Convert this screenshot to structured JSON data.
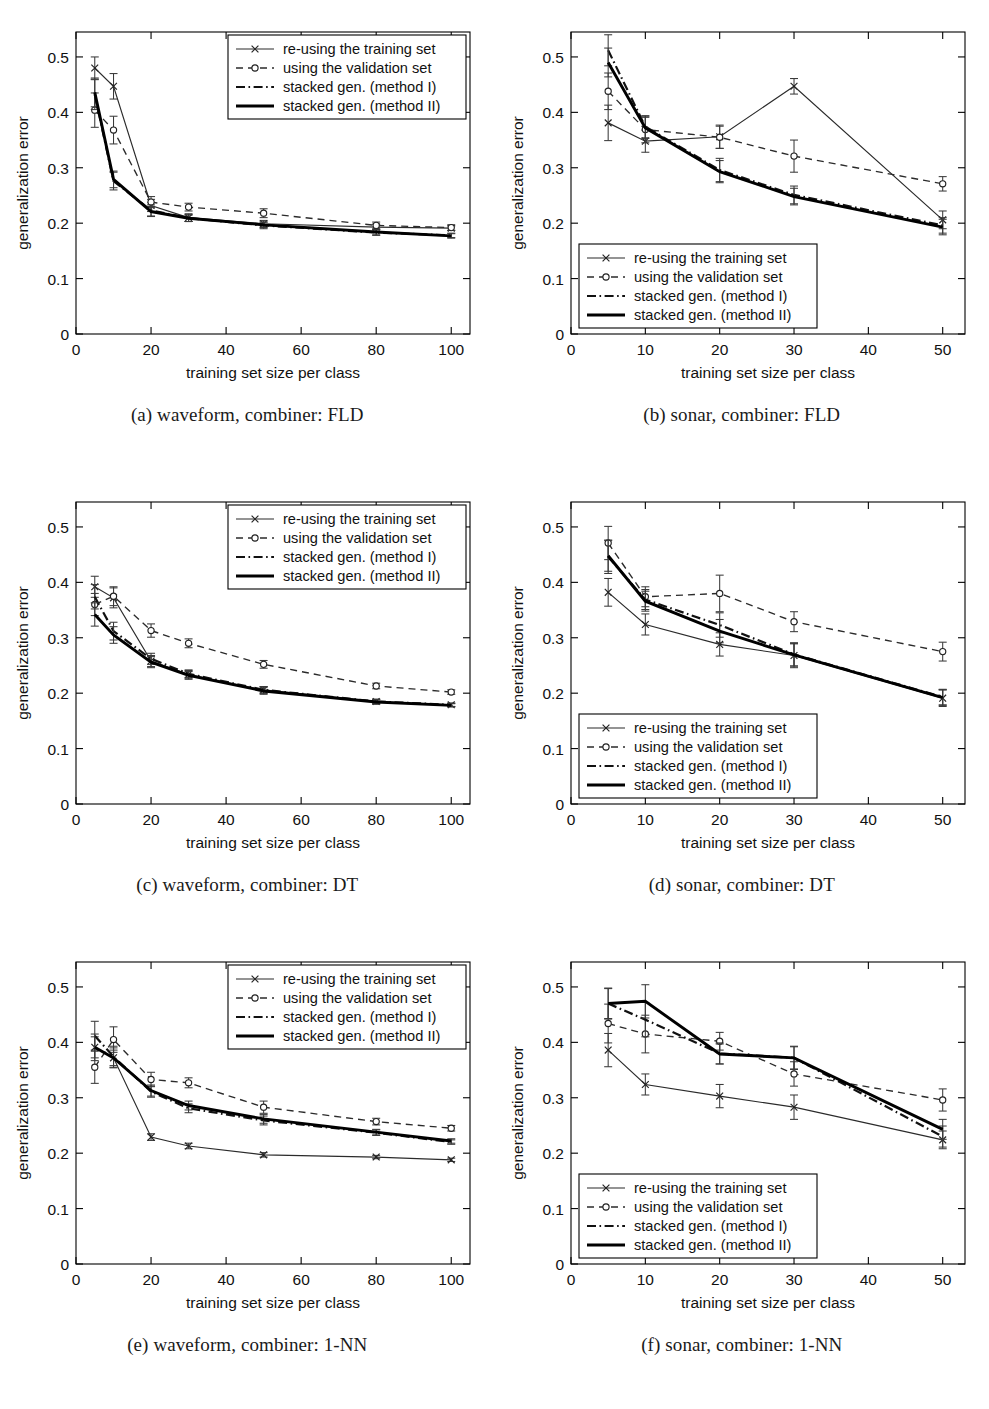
{
  "figure": {
    "axis": {
      "xlabel": "training set size per class",
      "ylabel": "generalization error"
    },
    "legend_entries": [
      {
        "label": "re-using the training set",
        "style": "solid-thin-marker-x"
      },
      {
        "label": "using the validation set",
        "style": "dashed-marker-circle"
      },
      {
        "label": "stacked gen. (method I)",
        "style": "dash-dot-thick"
      },
      {
        "label": "stacked gen. (method II)",
        "style": "solid-thick"
      }
    ],
    "series_names": [
      "re-using the training set",
      "using the validation set",
      "stacked gen. (method I)",
      "stacked gen. (method II)"
    ]
  },
  "chart_data": [
    {
      "id": "a",
      "type": "line",
      "title": "(a) waveform, combiner: FLD",
      "caption_letter": "(a)",
      "caption_text": "waveform, combiner: FLD",
      "xlabel": "training set size per class",
      "ylabel": "generalization error",
      "xlim": [
        0,
        105
      ],
      "ylim": [
        0,
        0.545
      ],
      "xticks": [
        0,
        20,
        40,
        60,
        80,
        100
      ],
      "xticklabels": [
        "0",
        "20",
        "40",
        "60",
        "80",
        "100"
      ],
      "yticks": [
        0,
        0.1,
        0.2,
        0.3,
        0.4,
        0.5
      ],
      "yticklabels": [
        "0",
        "0.1",
        "0.2",
        "0.3",
        "0.4",
        "0.5"
      ],
      "x": [
        5,
        10,
        20,
        30,
        50,
        80,
        100
      ],
      "legend_position": "top-right",
      "grid": false,
      "series": [
        {
          "name": "re-using the training set",
          "style": "solid-thin-marker-x",
          "values": [
            0.48,
            0.447,
            0.232,
            0.21,
            0.199,
            0.193,
            0.191
          ],
          "err": [
            0.02,
            0.023,
            0.011,
            0.007,
            0.006,
            0.005,
            0.004
          ]
        },
        {
          "name": "using the validation set",
          "style": "dashed-marker-circle",
          "values": [
            0.404,
            0.368,
            0.238,
            0.229,
            0.218,
            0.196,
            0.192
          ],
          "err": [
            0.031,
            0.025,
            0.01,
            0.007,
            0.008,
            0.006,
            0.005
          ]
        },
        {
          "name": "stacked gen. (method I)",
          "style": "dash-dot-thick",
          "values": [
            0.432,
            0.276,
            0.223,
            0.209,
            0.196,
            0.183,
            0.178
          ],
          "err": [
            0.027,
            0.016,
            0.01,
            0.006,
            0.006,
            0.005,
            0.004
          ]
        },
        {
          "name": "stacked gen. (method II)",
          "style": "solid-thick",
          "values": [
            0.436,
            0.279,
            0.221,
            0.209,
            0.197,
            0.184,
            0.177
          ],
          "err": [
            0.026,
            0.015,
            0.009,
            0.006,
            0.005,
            0.005,
            0.004
          ]
        }
      ]
    },
    {
      "id": "b",
      "type": "line",
      "title": "(b) sonar, combiner: FLD",
      "caption_letter": "(b)",
      "caption_text": "sonar, combiner: FLD",
      "xlabel": "training set size per class",
      "ylabel": "generalization error",
      "xlim": [
        0,
        53
      ],
      "ylim": [
        0,
        0.545
      ],
      "xticks": [
        0,
        10,
        20,
        30,
        40,
        50
      ],
      "xticklabels": [
        "0",
        "10",
        "20",
        "30",
        "40",
        "50"
      ],
      "yticks": [
        0,
        0.1,
        0.2,
        0.3,
        0.4,
        0.5
      ],
      "yticklabels": [
        "0",
        "0.1",
        "0.2",
        "0.3",
        "0.4",
        "0.5"
      ],
      "x": [
        5,
        10,
        20,
        30,
        50
      ],
      "legend_position": "bottom-left",
      "grid": false,
      "series": [
        {
          "name": "re-using the training set",
          "style": "solid-thin-marker-x",
          "values": [
            0.381,
            0.348,
            0.356,
            0.447,
            0.206
          ],
          "err": [
            0.032,
            0.02,
            0.021,
            0.014,
            0.016
          ]
        },
        {
          "name": "using the validation set",
          "style": "dashed-marker-circle",
          "values": [
            0.438,
            0.369,
            0.355,
            0.321,
            0.271
          ],
          "err": [
            0.033,
            0.024,
            0.02,
            0.029,
            0.013
          ]
        },
        {
          "name": "stacked gen. (method I)",
          "style": "dash-dot-thick",
          "values": [
            0.512,
            0.374,
            0.296,
            0.251,
            0.196
          ],
          "err": [
            0.028,
            0.02,
            0.021,
            0.016,
            0.014
          ]
        },
        {
          "name": "stacked gen. (method II)",
          "style": "solid-thick",
          "values": [
            0.49,
            0.372,
            0.293,
            0.248,
            0.193
          ],
          "err": [
            0.026,
            0.019,
            0.02,
            0.015,
            0.014
          ]
        }
      ]
    },
    {
      "id": "c",
      "type": "line",
      "title": "(c) waveform, combiner: DT",
      "caption_letter": "(c)",
      "caption_text": "waveform, combiner: DT",
      "xlabel": "training set size per class",
      "ylabel": "generalization error",
      "xlim": [
        0,
        105
      ],
      "ylim": [
        0,
        0.545
      ],
      "xticks": [
        0,
        20,
        40,
        60,
        80,
        100
      ],
      "xticklabels": [
        "0",
        "20",
        "40",
        "60",
        "80",
        "100"
      ],
      "yticks": [
        0,
        0.1,
        0.2,
        0.3,
        0.4,
        0.5
      ],
      "yticklabels": [
        "0",
        "0.1",
        "0.2",
        "0.3",
        "0.4",
        "0.5"
      ],
      "x": [
        5,
        10,
        20,
        30,
        50,
        80,
        100
      ],
      "legend_position": "top-right",
      "grid": false,
      "series": [
        {
          "name": "re-using the training set",
          "style": "solid-thin-marker-x",
          "values": [
            0.392,
            0.372,
            0.258,
            0.234,
            0.206,
            0.185,
            0.179
          ],
          "err": [
            0.019,
            0.018,
            0.01,
            0.007,
            0.006,
            0.004,
            0.003
          ]
        },
        {
          "name": "using the validation set",
          "style": "dashed-marker-circle",
          "values": [
            0.36,
            0.375,
            0.313,
            0.29,
            0.252,
            0.213,
            0.202
          ],
          "err": [
            0.02,
            0.017,
            0.012,
            0.008,
            0.007,
            0.005,
            0.004
          ]
        },
        {
          "name": "stacked gen. (method I)",
          "style": "dash-dot-thick",
          "values": [
            0.374,
            0.312,
            0.262,
            0.235,
            0.206,
            0.185,
            0.179
          ],
          "err": [
            0.022,
            0.016,
            0.01,
            0.007,
            0.006,
            0.004,
            0.003
          ]
        },
        {
          "name": "stacked gen. (method II)",
          "style": "solid-thick",
          "values": [
            0.342,
            0.305,
            0.256,
            0.232,
            0.204,
            0.184,
            0.178
          ],
          "err": [
            0.021,
            0.015,
            0.01,
            0.007,
            0.006,
            0.004,
            0.003
          ]
        }
      ]
    },
    {
      "id": "d",
      "type": "line",
      "title": "(d) sonar, combiner: DT",
      "caption_letter": "(d)",
      "caption_text": "sonar, combiner: DT",
      "xlabel": "training set size per class",
      "ylabel": "generalization error",
      "xlim": [
        0,
        53
      ],
      "ylim": [
        0,
        0.545
      ],
      "xticks": [
        0,
        10,
        20,
        30,
        40,
        50
      ],
      "xticklabels": [
        "0",
        "10",
        "20",
        "30",
        "40",
        "50"
      ],
      "yticks": [
        0,
        0.1,
        0.2,
        0.3,
        0.4,
        0.5
      ],
      "yticklabels": [
        "0",
        "0.1",
        "0.2",
        "0.3",
        "0.4",
        "0.5"
      ],
      "x": [
        5,
        10,
        20,
        30,
        50
      ],
      "legend_position": "bottom-left",
      "grid": false,
      "series": [
        {
          "name": "re-using the training set",
          "style": "solid-thin-marker-x",
          "values": [
            0.382,
            0.324,
            0.288,
            0.268,
            0.191
          ],
          "err": [
            0.025,
            0.019,
            0.021,
            0.022,
            0.015
          ]
        },
        {
          "name": "using the validation set",
          "style": "dashed-marker-circle",
          "values": [
            0.471,
            0.374,
            0.38,
            0.329,
            0.275
          ],
          "err": [
            0.03,
            0.018,
            0.033,
            0.018,
            0.017
          ]
        },
        {
          "name": "stacked gen. (method I)",
          "style": "dash-dot-thick",
          "values": [
            0.446,
            0.369,
            0.323,
            0.27,
            0.193
          ],
          "err": [
            0.03,
            0.018,
            0.022,
            0.021,
            0.014
          ]
        },
        {
          "name": "stacked gen. (method II)",
          "style": "solid-thick",
          "values": [
            0.448,
            0.366,
            0.312,
            0.269,
            0.192
          ],
          "err": [
            0.028,
            0.018,
            0.021,
            0.02,
            0.014
          ]
        }
      ]
    },
    {
      "id": "e",
      "type": "line",
      "title": "(e) waveform, combiner: 1-NN",
      "caption_letter": "(e)",
      "caption_text": "waveform, combiner: 1-NN",
      "xlabel": "training set size per class",
      "ylabel": "generalization error",
      "xlim": [
        0,
        105
      ],
      "ylim": [
        0,
        0.545
      ],
      "xticks": [
        0,
        20,
        40,
        60,
        80,
        100
      ],
      "xticklabels": [
        "0",
        "20",
        "40",
        "60",
        "80",
        "100"
      ],
      "yticks": [
        0,
        0.1,
        0.2,
        0.3,
        0.4,
        0.5
      ],
      "yticklabels": [
        "0",
        "0.1",
        "0.2",
        "0.3",
        "0.4",
        "0.5"
      ],
      "x": [
        5,
        10,
        20,
        30,
        50,
        80,
        100
      ],
      "legend_position": "top-right",
      "grid": false,
      "series": [
        {
          "name": "re-using the training set",
          "style": "solid-thin-marker-x",
          "values": [
            0.391,
            0.372,
            0.229,
            0.213,
            0.197,
            0.193,
            0.188
          ],
          "err": [
            0.019,
            0.014,
            0.006,
            0.005,
            0.004,
            0.003,
            0.003
          ]
        },
        {
          "name": "using the validation set",
          "style": "dashed-marker-circle",
          "values": [
            0.355,
            0.405,
            0.333,
            0.327,
            0.283,
            0.257,
            0.245
          ],
          "err": [
            0.029,
            0.023,
            0.013,
            0.009,
            0.011,
            0.006,
            0.005
          ]
        },
        {
          "name": "stacked gen. (method I)",
          "style": "dash-dot-thick",
          "values": [
            0.412,
            0.374,
            0.311,
            0.281,
            0.259,
            0.237,
            0.22
          ],
          "err": [
            0.026,
            0.019,
            0.01,
            0.008,
            0.008,
            0.005,
            0.004
          ]
        },
        {
          "name": "stacked gen. (method II)",
          "style": "solid-thick",
          "values": [
            0.391,
            0.372,
            0.313,
            0.286,
            0.262,
            0.238,
            0.222
          ],
          "err": [
            0.024,
            0.018,
            0.01,
            0.008,
            0.008,
            0.005,
            0.004
          ]
        }
      ]
    },
    {
      "id": "f",
      "type": "line",
      "title": "(f) sonar, combiner: 1-NN",
      "caption_letter": "(f)",
      "caption_text": "sonar, combiner: 1-NN",
      "xlabel": "training set size per class",
      "ylabel": "generalization error",
      "xlim": [
        0,
        53
      ],
      "ylim": [
        0,
        0.545
      ],
      "xticks": [
        0,
        10,
        20,
        30,
        40,
        50
      ],
      "xticklabels": [
        "0",
        "10",
        "20",
        "30",
        "40",
        "50"
      ],
      "yticks": [
        0,
        0.1,
        0.2,
        0.3,
        0.4,
        0.5
      ],
      "yticklabels": [
        "0",
        "0.1",
        "0.2",
        "0.3",
        "0.4",
        "0.5"
      ],
      "x": [
        5,
        10,
        20,
        30,
        50
      ],
      "legend_position": "bottom-left",
      "grid": false,
      "series": [
        {
          "name": "re-using the training set",
          "style": "solid-thin-marker-x",
          "values": [
            0.386,
            0.324,
            0.303,
            0.283,
            0.224
          ],
          "err": [
            0.03,
            0.019,
            0.021,
            0.022,
            0.016
          ]
        },
        {
          "name": "using the validation set",
          "style": "dashed-marker-circle",
          "values": [
            0.434,
            0.415,
            0.402,
            0.343,
            0.296
          ],
          "err": [
            0.035,
            0.034,
            0.016,
            0.022,
            0.02
          ]
        },
        {
          "name": "stacked gen. (method I)",
          "style": "dash-dot-thick",
          "values": [
            0.47,
            0.441,
            0.38,
            0.372,
            0.23
          ],
          "err": [
            0.028,
            0.031,
            0.019,
            0.021,
            0.019
          ]
        },
        {
          "name": "stacked gen. (method II)",
          "style": "solid-thick",
          "values": [
            0.47,
            0.474,
            0.379,
            0.372,
            0.243
          ],
          "err": [
            0.027,
            0.03,
            0.018,
            0.02,
            0.018
          ]
        }
      ]
    }
  ]
}
